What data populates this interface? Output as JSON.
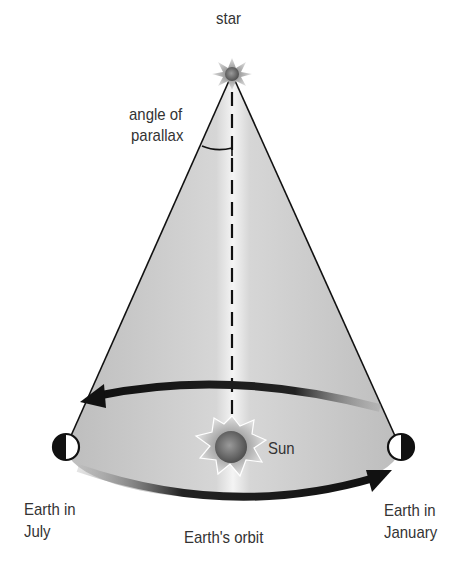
{
  "diagram": {
    "labels": {
      "star": "star",
      "angle_line1": "angle of",
      "angle_line2": "parallax",
      "sun": "Sun",
      "july_line1": "Earth in",
      "july_line2": "July",
      "january_line1": "Earth in",
      "january_line2": "January",
      "orbit": "Earth's orbit"
    },
    "colors": {
      "cone_fill": "#c8c8c8",
      "lines": "#111111",
      "text": "#333333",
      "sun_body": "#6a6a6a",
      "star_body": "#6a6a6a"
    }
  }
}
